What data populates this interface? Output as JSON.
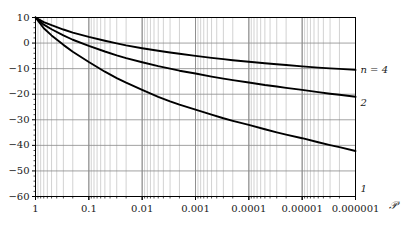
{
  "chart_data": {
    "type": "line",
    "title": "",
    "xlabel": "𝒫",
    "ylabel": "",
    "xscale": "log-reversed",
    "x_tick_labels": [
      "1",
      "0.1",
      "0.01",
      "0.001",
      "0.0001",
      "0.00001",
      "0.000001"
    ],
    "x_tick_values": [
      1,
      0.1,
      0.01,
      0.001,
      0.0001,
      1e-05,
      1e-06
    ],
    "xlim": [
      1,
      1e-06
    ],
    "y_tick_labels": [
      "10",
      "0",
      "−10",
      "−20",
      "−30",
      "−40",
      "−50",
      "−60"
    ],
    "y_tick_values": [
      10,
      0,
      -10,
      -20,
      -30,
      -40,
      -50,
      -60
    ],
    "ylim": [
      -60,
      10
    ],
    "grid": "log-minor-vertical-and-major-horizontal",
    "legend_position": "right-of-curve-ends",
    "series": [
      {
        "name": "n = 4",
        "label": "n = 4",
        "label_x": 7e-07,
        "label_y": -10.5,
        "points": [
          [
            1,
            10.0
          ],
          [
            0.7,
            8.2
          ],
          [
            0.5,
            7.0
          ],
          [
            0.3,
            5.3
          ],
          [
            0.2,
            4.1
          ],
          [
            0.1,
            2.4
          ],
          [
            0.05,
            0.9
          ],
          [
            0.03,
            -0.1
          ],
          [
            0.02,
            -0.9
          ],
          [
            0.01,
            -2.0
          ],
          [
            0.005,
            -3.0
          ],
          [
            0.003,
            -3.7
          ],
          [
            0.002,
            -4.2
          ],
          [
            0.001,
            -5.0
          ],
          [
            0.0005,
            -5.8
          ],
          [
            0.0003,
            -6.3
          ],
          [
            0.0002,
            -6.7
          ],
          [
            0.0001,
            -7.3
          ],
          [
            5e-05,
            -7.9
          ],
          [
            3e-05,
            -8.3
          ],
          [
            2e-05,
            -8.6
          ],
          [
            1e-05,
            -9.1
          ],
          [
            5e-06,
            -9.6
          ],
          [
            3e-06,
            -9.9
          ],
          [
            2e-06,
            -10.1
          ],
          [
            1e-06,
            -10.5
          ]
        ]
      },
      {
        "name": "2",
        "label": "2",
        "label_x": 7e-07,
        "label_y": -23.5,
        "points": [
          [
            1,
            10.0
          ],
          [
            0.7,
            7.2
          ],
          [
            0.5,
            5.4
          ],
          [
            0.3,
            3.0
          ],
          [
            0.2,
            1.3
          ],
          [
            0.1,
            -1.1
          ],
          [
            0.05,
            -3.3
          ],
          [
            0.03,
            -4.8
          ],
          [
            0.02,
            -5.9
          ],
          [
            0.01,
            -7.5
          ],
          [
            0.005,
            -9.0
          ],
          [
            0.003,
            -10.0
          ],
          [
            0.002,
            -10.8
          ],
          [
            0.001,
            -11.9
          ],
          [
            0.0005,
            -13.1
          ],
          [
            0.0003,
            -13.9
          ],
          [
            0.0002,
            -14.5
          ],
          [
            0.0001,
            -15.4
          ],
          [
            5e-05,
            -16.4
          ],
          [
            3e-05,
            -17.0
          ],
          [
            2e-05,
            -17.5
          ],
          [
            1e-05,
            -18.3
          ],
          [
            5e-06,
            -19.2
          ],
          [
            3e-06,
            -19.8
          ],
          [
            2e-06,
            -20.2
          ],
          [
            1e-06,
            -21.0
          ]
        ]
      },
      {
        "name": "1",
        "label": "1",
        "label_x": 7e-07,
        "label_y": -57.0,
        "points": [
          [
            1,
            10.0
          ],
          [
            0.7,
            5.8
          ],
          [
            0.5,
            3.0
          ],
          [
            0.3,
            -0.7
          ],
          [
            0.2,
            -3.4
          ],
          [
            0.1,
            -7.4
          ],
          [
            0.05,
            -11.2
          ],
          [
            0.03,
            -13.7
          ],
          [
            0.02,
            -15.5
          ],
          [
            0.01,
            -18.3
          ],
          [
            0.005,
            -21.0
          ],
          [
            0.003,
            -22.8
          ],
          [
            0.002,
            -24.1
          ],
          [
            0.001,
            -26.0
          ],
          [
            0.0005,
            -28.0
          ],
          [
            0.0003,
            -29.4
          ],
          [
            0.0002,
            -30.4
          ],
          [
            0.0001,
            -32.0
          ],
          [
            5e-05,
            -33.7
          ],
          [
            3e-05,
            -34.9
          ],
          [
            2e-05,
            -35.8
          ],
          [
            1e-05,
            -37.2
          ],
          [
            5e-06,
            -38.8
          ],
          [
            3e-06,
            -39.9
          ],
          [
            2e-06,
            -40.7
          ],
          [
            1e-06,
            -42.2
          ]
        ]
      }
    ]
  },
  "axes": {
    "x_title": "𝒫",
    "x_labels": [
      "1",
      "0.1",
      "0.01",
      "0.001",
      "0.0001",
      "0.00001",
      "0.000001"
    ],
    "y_labels": [
      "10",
      "0",
      "−10",
      "−20",
      "−30",
      "−40",
      "−50",
      "−60"
    ]
  },
  "curve_labels": {
    "top": "n = 4",
    "middle": "2",
    "bottom": "1"
  }
}
